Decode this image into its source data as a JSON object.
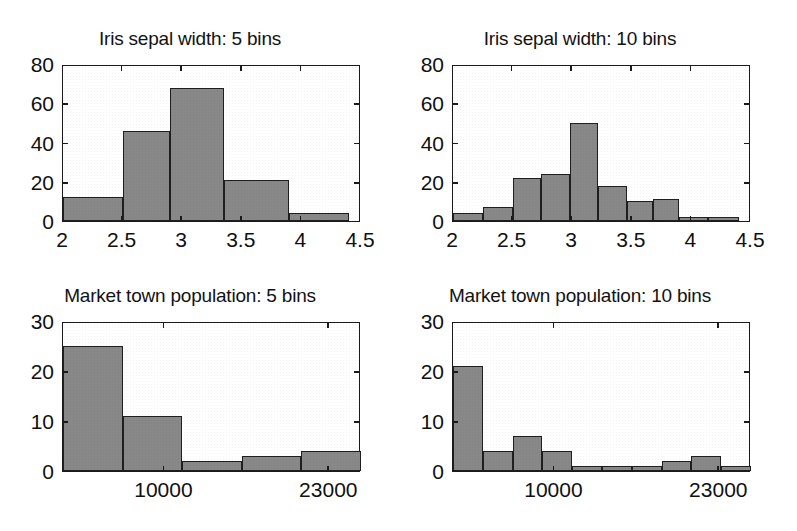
{
  "figure": {
    "background": "#ffffff",
    "bar_fill": "#888888",
    "bar_edge": "#1f1f1f",
    "axis_color": "#1a1a1a"
  },
  "panels": [
    {
      "id": "iris-5-bins",
      "title": "Iris sepal width: 5 bins",
      "chart_data": {
        "type": "bar",
        "title": "Iris sepal width: 5 bins",
        "xlabel": "",
        "ylabel": "",
        "grid": false,
        "legend": null,
        "xlim": [
          2,
          4.5
        ],
        "ylim": [
          0,
          80
        ],
        "xticks": [
          2,
          2.5,
          3,
          3.5,
          4,
          4.5
        ],
        "xtick_labels": [
          "2",
          "2.5",
          "3",
          "3.5",
          "4",
          "4.5"
        ],
        "yticks": [
          0,
          20,
          40,
          60,
          80
        ],
        "ytick_labels": [
          "0",
          "20",
          "40",
          "60",
          "80"
        ],
        "bin_edges": [
          2.0,
          2.5,
          2.9,
          3.35,
          3.9,
          4.4
        ],
        "categories": [
          "2.0-2.5",
          "2.5-2.9",
          "2.9-3.35",
          "3.35-3.9",
          "3.9-4.4"
        ],
        "values": [
          12,
          46,
          68,
          21,
          4
        ]
      }
    },
    {
      "id": "iris-10-bins",
      "title": "Iris sepal width: 10 bins",
      "chart_data": {
        "type": "bar",
        "title": "Iris sepal width: 10 bins",
        "xlabel": "",
        "ylabel": "",
        "grid": false,
        "legend": null,
        "xlim": [
          2,
          4.5
        ],
        "ylim": [
          0,
          80
        ],
        "xticks": [
          2,
          2.5,
          3,
          3.5,
          4,
          4.5
        ],
        "xtick_labels": [
          "2",
          "2.5",
          "3",
          "3.5",
          "4",
          "4.5"
        ],
        "yticks": [
          0,
          20,
          40,
          60,
          80
        ],
        "ytick_labels": [
          "0",
          "20",
          "40",
          "60",
          "80"
        ],
        "bin_edges": [
          2.0,
          2.25,
          2.5,
          2.74,
          2.98,
          3.22,
          3.46,
          3.68,
          3.9,
          4.14,
          4.4
        ],
        "categories": [
          "2.0-2.25",
          "2.25-2.5",
          "2.5-2.74",
          "2.74-2.98",
          "2.98-3.22",
          "3.22-3.46",
          "3.46-3.68",
          "3.68-3.9",
          "3.9-4.14",
          "4.14-4.4"
        ],
        "values": [
          4,
          7,
          22,
          24,
          50,
          18,
          10,
          11,
          2,
          2
        ]
      }
    },
    {
      "id": "market-town-5-bins",
      "title": "Market town population: 5 bins",
      "chart_data": {
        "type": "bar",
        "title": "Market town population: 5 bins",
        "xlabel": "",
        "ylabel": "",
        "grid": false,
        "legend": null,
        "xlim": [
          2000,
          25500
        ],
        "ylim": [
          0,
          30
        ],
        "xticks": [
          10000,
          23000
        ],
        "xtick_labels": [
          "10000",
          "23000"
        ],
        "yticks": [
          0,
          10,
          20,
          30
        ],
        "ytick_labels": [
          "0",
          "10",
          "20",
          "30"
        ],
        "bin_edges": [
          2000,
          6700,
          11400,
          16100,
          20800,
          25500
        ],
        "categories": [
          "2000-6700",
          "6700-11400",
          "11400-16100",
          "16100-20800",
          "20800-25500"
        ],
        "values": [
          25,
          11,
          2,
          3,
          4
        ]
      }
    },
    {
      "id": "market-town-10-bins",
      "title": "Market town population: 10 bins",
      "chart_data": {
        "type": "bar",
        "title": "Market town population: 10 bins",
        "xlabel": "",
        "ylabel": "",
        "grid": false,
        "legend": null,
        "xlim": [
          2000,
          25500
        ],
        "ylim": [
          0,
          30
        ],
        "xticks": [
          10000,
          23000
        ],
        "xtick_labels": [
          "10000",
          "23000"
        ],
        "yticks": [
          0,
          10,
          20,
          30
        ],
        "ytick_labels": [
          "0",
          "10",
          "20",
          "30"
        ],
        "bin_edges": [
          2000,
          4350,
          6700,
          9050,
          11400,
          13750,
          16100,
          18450,
          20800,
          23150,
          25500
        ],
        "categories": [
          "2000-4350",
          "4350-6700",
          "6700-9050",
          "9050-11400",
          "11400-13750",
          "13750-16100",
          "16100-18450",
          "18450-20800",
          "20800-23150",
          "23150-25500"
        ],
        "values": [
          21,
          4,
          7,
          4,
          1,
          1,
          1,
          2,
          3,
          1
        ]
      }
    }
  ]
}
